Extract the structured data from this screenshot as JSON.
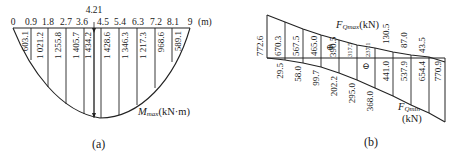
{
  "diagram_a": {
    "caption": "(a)",
    "axis_unit": "(m)",
    "x_ticks": [
      "0",
      "0.9",
      "1.8",
      "2.7",
      "3.6",
      "4.5",
      "5.4",
      "6.3",
      "7.2",
      "8.1",
      "9"
    ],
    "peak_position_label": "4.21",
    "curve_label": "M",
    "curve_label_sub": "max",
    "curve_label_unit": "(kN·m)",
    "moment_values": [
      "603.1",
      "1 021.2",
      "1 255.8",
      "1 405.7",
      "1 434.2",
      "1 428.6",
      "1 346.3",
      "1 217.3",
      "968.6",
      "589.1"
    ]
  },
  "diagram_b": {
    "caption": "(b)",
    "top_label": "F",
    "top_label_sub": "Qmax",
    "top_label_unit": "(kN)",
    "bottom_label": "F",
    "bottom_label_sub": "Qmin",
    "bottom_label_unit": "(kN)",
    "positive_sign": "⊕",
    "negative_sign": "⊖",
    "fqmax_values": [
      "772.6",
      "670.3",
      "567.5",
      "465.0",
      "390.5",
      "317.5",
      "237.1",
      "130.5",
      "87.0",
      "43.5"
    ],
    "fqmin_values": [
      "29.5",
      "58.0",
      "99.7",
      "202.2",
      "295.0",
      "368.0",
      "441.0",
      "537.9",
      "654.4",
      "770.9"
    ]
  }
}
